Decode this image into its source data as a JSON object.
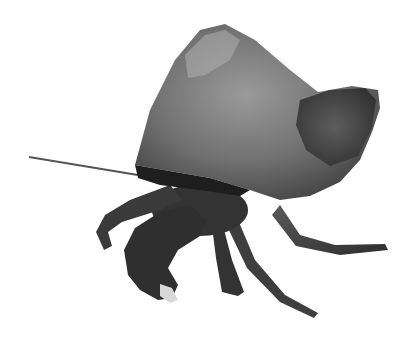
{
  "image": {
    "subject": "hermit crab",
    "background_color": "#ffffff",
    "palette": {
      "shell_light": "#8a8a8a",
      "shell_mid": "#6a6a6a",
      "shell_dark": "#3a3a3a",
      "body_dark": "#2e2e2e",
      "legs": "#4a4a4a",
      "claw_tip": "#d8d8d8",
      "antenna": "#555555"
    }
  }
}
